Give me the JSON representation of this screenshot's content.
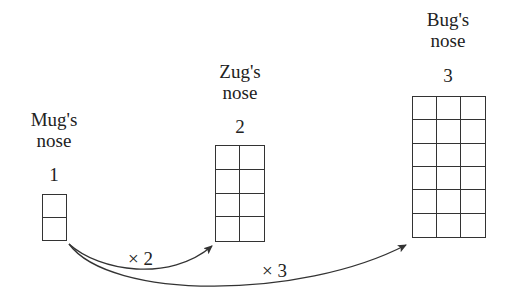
{
  "noses": [
    {
      "name_line1": "Mug's",
      "name_line2": "nose",
      "number": "1",
      "columns": 1,
      "rows": 2
    },
    {
      "name_line1": "Zug's",
      "name_line2": "nose",
      "number": "2",
      "columns": 2,
      "rows": 4
    },
    {
      "name_line1": "Bug's",
      "name_line2": "nose",
      "number": "3",
      "columns": 3,
      "rows": 6
    }
  ],
  "arrows": [
    {
      "from": "Mug's nose",
      "to": "Zug's nose",
      "label": "× 2"
    },
    {
      "from": "Mug's nose",
      "to": "Bug's nose",
      "label": "× 3"
    }
  ],
  "colors": {
    "line": "#333333",
    "text": "#222222",
    "background": "#ffffff"
  }
}
